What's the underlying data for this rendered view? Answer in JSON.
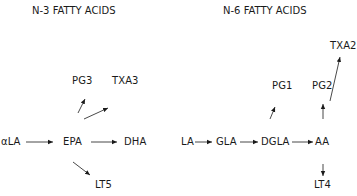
{
  "diagram": {
    "n3": {
      "title": "N-3 FATTY ACIDS",
      "nodes": {
        "ala": "αLA",
        "epa": "EPA",
        "dha": "DHA",
        "pg3": "PG3",
        "txa3": "TXA3",
        "lt5": "LT5"
      }
    },
    "n6": {
      "title": "N-6 FATTY ACIDS",
      "nodes": {
        "la": "LA",
        "gla": "GLA",
        "dgla": "DGLA",
        "aa": "AA",
        "pg1": "PG1",
        "pg2": "PG2",
        "txa2": "TXA2",
        "lt4": "LT4"
      }
    },
    "edges": [
      [
        "αLA",
        "EPA"
      ],
      [
        "EPA",
        "DHA"
      ],
      [
        "EPA",
        "PG3"
      ],
      [
        "EPA",
        "TXA3"
      ],
      [
        "EPA",
        "LT5"
      ],
      [
        "LA",
        "GLA"
      ],
      [
        "GLA",
        "DGLA"
      ],
      [
        "DGLA",
        "AA"
      ],
      [
        "DGLA",
        "PG1"
      ],
      [
        "AA",
        "PG2"
      ],
      [
        "AA",
        "TXA2"
      ],
      [
        "AA",
        "LT4"
      ]
    ],
    "colors": {
      "ink": "#1a1a1a",
      "background": "#ffffff"
    }
  }
}
